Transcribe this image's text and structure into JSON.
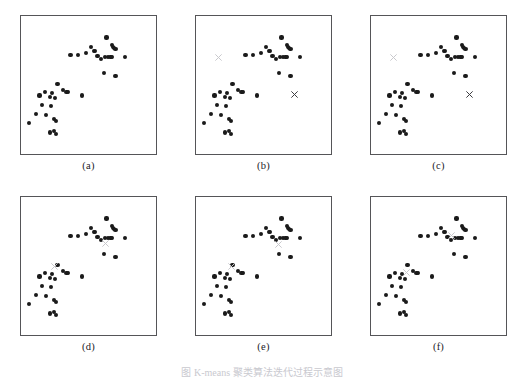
{
  "figure": {
    "title_caption": "图  K-means  聚类算法迭代过程示意图",
    "background_color": "#ffffff",
    "border_color": "#555558",
    "dot_color": "#1a1a1a",
    "centroid_color_light": "#c8c8cc",
    "centroid_color_dark": "#3a3a3e",
    "panel_labels": [
      "(a)",
      "(b)",
      "(c)",
      "(d)",
      "(e)",
      "(f)"
    ]
  },
  "chart_data": {
    "type": "scatter",
    "xlabel": "",
    "ylabel": "",
    "xlim": [
      0,
      100
    ],
    "ylim": [
      0,
      100
    ],
    "grid": false,
    "legend": "none",
    "marker_shapes": {
      "data_point": "filled-circle",
      "centroid": "cross"
    },
    "panels": [
      {
        "label": "(a)",
        "name": "original-data",
        "annotation": "Original unlabeled data points",
        "points": [
          [
            64,
            86
          ],
          [
            52,
            79
          ],
          [
            68,
            80
          ],
          [
            69,
            79
          ],
          [
            70,
            78
          ],
          [
            71,
            77
          ],
          [
            54,
            76
          ],
          [
            55,
            76
          ],
          [
            36,
            73
          ],
          [
            42,
            73
          ],
          [
            48,
            74
          ],
          [
            57,
            72
          ],
          [
            60,
            70
          ],
          [
            63,
            71
          ],
          [
            65,
            71
          ],
          [
            67,
            71
          ],
          [
            68,
            71
          ],
          [
            78,
            71
          ],
          [
            62,
            59
          ],
          [
            71,
            57
          ],
          [
            26,
            51
          ],
          [
            16,
            45
          ],
          [
            22,
            44
          ],
          [
            30,
            46
          ],
          [
            33,
            45
          ],
          [
            34,
            45
          ],
          [
            12,
            42
          ],
          [
            20,
            41
          ],
          [
            24,
            40
          ],
          [
            45,
            42
          ],
          [
            14,
            35
          ],
          [
            21,
            34
          ],
          [
            9,
            28
          ],
          [
            17,
            27
          ],
          [
            23,
            24
          ],
          [
            25,
            23
          ],
          [
            4,
            21
          ],
          [
            20,
            14
          ],
          [
            23,
            15
          ],
          [
            25,
            13
          ]
        ],
        "centroids": []
      },
      {
        "label": "(b)",
        "name": "initial-centroids",
        "annotation": "Two initial centroids placed randomly",
        "points": [
          [
            64,
            86
          ],
          [
            52,
            79
          ],
          [
            68,
            80
          ],
          [
            69,
            79
          ],
          [
            70,
            78
          ],
          [
            71,
            77
          ],
          [
            54,
            76
          ],
          [
            55,
            76
          ],
          [
            36,
            73
          ],
          [
            42,
            73
          ],
          [
            48,
            74
          ],
          [
            57,
            72
          ],
          [
            60,
            70
          ],
          [
            63,
            71
          ],
          [
            65,
            71
          ],
          [
            67,
            71
          ],
          [
            68,
            71
          ],
          [
            78,
            71
          ],
          [
            62,
            59
          ],
          [
            71,
            57
          ],
          [
            26,
            51
          ],
          [
            16,
            45
          ],
          [
            22,
            44
          ],
          [
            30,
            46
          ],
          [
            33,
            45
          ],
          [
            34,
            45
          ],
          [
            12,
            42
          ],
          [
            20,
            41
          ],
          [
            24,
            40
          ],
          [
            45,
            42
          ],
          [
            14,
            35
          ],
          [
            21,
            34
          ],
          [
            9,
            28
          ],
          [
            17,
            27
          ],
          [
            23,
            24
          ],
          [
            25,
            23
          ],
          [
            4,
            21
          ],
          [
            20,
            14
          ],
          [
            23,
            15
          ],
          [
            25,
            13
          ]
        ],
        "centroids": [
          {
            "x": 15,
            "y": 71,
            "shade": "light"
          },
          {
            "x": 74,
            "y": 43,
            "shade": "dark"
          }
        ]
      },
      {
        "label": "(c)",
        "name": "assignment-step",
        "annotation": "Points assigned to nearest centroid",
        "points": [
          [
            64,
            86
          ],
          [
            52,
            79
          ],
          [
            68,
            80
          ],
          [
            69,
            79
          ],
          [
            70,
            78
          ],
          [
            71,
            77
          ],
          [
            54,
            76
          ],
          [
            55,
            76
          ],
          [
            36,
            73
          ],
          [
            42,
            73
          ],
          [
            48,
            74
          ],
          [
            57,
            72
          ],
          [
            60,
            70
          ],
          [
            63,
            71
          ],
          [
            65,
            71
          ],
          [
            67,
            71
          ],
          [
            68,
            71
          ],
          [
            78,
            71
          ],
          [
            62,
            59
          ],
          [
            71,
            57
          ],
          [
            26,
            51
          ],
          [
            16,
            45
          ],
          [
            22,
            44
          ],
          [
            30,
            46
          ],
          [
            33,
            45
          ],
          [
            34,
            45
          ],
          [
            12,
            42
          ],
          [
            20,
            41
          ],
          [
            24,
            40
          ],
          [
            45,
            42
          ],
          [
            14,
            35
          ],
          [
            21,
            34
          ],
          [
            9,
            28
          ],
          [
            17,
            27
          ],
          [
            23,
            24
          ],
          [
            25,
            23
          ],
          [
            4,
            21
          ],
          [
            20,
            14
          ],
          [
            23,
            15
          ],
          [
            25,
            13
          ]
        ],
        "centroids": [
          {
            "x": 15,
            "y": 71,
            "shade": "light"
          },
          {
            "x": 74,
            "y": 43,
            "shade": "dark"
          }
        ]
      },
      {
        "label": "(d)",
        "name": "update-step-1",
        "annotation": "Centroids moved to cluster means",
        "points": [
          [
            64,
            86
          ],
          [
            52,
            79
          ],
          [
            68,
            80
          ],
          [
            69,
            79
          ],
          [
            70,
            78
          ],
          [
            71,
            77
          ],
          [
            54,
            76
          ],
          [
            55,
            76
          ],
          [
            36,
            73
          ],
          [
            42,
            73
          ],
          [
            48,
            74
          ],
          [
            57,
            72
          ],
          [
            60,
            70
          ],
          [
            63,
            71
          ],
          [
            65,
            71
          ],
          [
            67,
            71
          ],
          [
            68,
            71
          ],
          [
            78,
            71
          ],
          [
            62,
            59
          ],
          [
            71,
            57
          ],
          [
            26,
            51
          ],
          [
            16,
            45
          ],
          [
            22,
            44
          ],
          [
            30,
            46
          ],
          [
            33,
            45
          ],
          [
            34,
            45
          ],
          [
            12,
            42
          ],
          [
            20,
            41
          ],
          [
            24,
            40
          ],
          [
            45,
            42
          ],
          [
            14,
            35
          ],
          [
            21,
            34
          ],
          [
            9,
            28
          ],
          [
            17,
            27
          ],
          [
            23,
            24
          ],
          [
            25,
            23
          ],
          [
            4,
            21
          ],
          [
            20,
            14
          ],
          [
            23,
            15
          ],
          [
            25,
            13
          ]
        ],
        "centroids": [
          {
            "x": 24,
            "y": 50,
            "shade": "light"
          },
          {
            "x": 63,
            "y": 67,
            "shade": "light"
          }
        ]
      },
      {
        "label": "(e)",
        "name": "update-step-2",
        "annotation": "Centroids refined further",
        "points": [
          [
            64,
            86
          ],
          [
            52,
            79
          ],
          [
            68,
            80
          ],
          [
            69,
            79
          ],
          [
            70,
            78
          ],
          [
            71,
            77
          ],
          [
            54,
            76
          ],
          [
            55,
            76
          ],
          [
            36,
            73
          ],
          [
            42,
            73
          ],
          [
            48,
            74
          ],
          [
            57,
            72
          ],
          [
            60,
            70
          ],
          [
            63,
            71
          ],
          [
            65,
            71
          ],
          [
            67,
            71
          ],
          [
            68,
            71
          ],
          [
            78,
            71
          ],
          [
            62,
            59
          ],
          [
            71,
            57
          ],
          [
            26,
            51
          ],
          [
            16,
            45
          ],
          [
            22,
            44
          ],
          [
            30,
            46
          ],
          [
            33,
            45
          ],
          [
            34,
            45
          ],
          [
            12,
            42
          ],
          [
            20,
            41
          ],
          [
            24,
            40
          ],
          [
            45,
            42
          ],
          [
            14,
            35
          ],
          [
            21,
            34
          ],
          [
            9,
            28
          ],
          [
            17,
            27
          ],
          [
            23,
            24
          ],
          [
            25,
            23
          ],
          [
            4,
            21
          ],
          [
            20,
            14
          ],
          [
            23,
            15
          ],
          [
            25,
            13
          ]
        ],
        "centroids": [
          {
            "x": 25,
            "y": 50,
            "shade": "light"
          },
          {
            "x": 62,
            "y": 66,
            "shade": "light"
          }
        ]
      },
      {
        "label": "(f)",
        "name": "converged",
        "annotation": "Converged centroid positions",
        "points": [
          [
            64,
            86
          ],
          [
            52,
            79
          ],
          [
            68,
            80
          ],
          [
            69,
            79
          ],
          [
            70,
            78
          ],
          [
            71,
            77
          ],
          [
            54,
            76
          ],
          [
            55,
            76
          ],
          [
            36,
            73
          ],
          [
            42,
            73
          ],
          [
            48,
            74
          ],
          [
            57,
            72
          ],
          [
            60,
            70
          ],
          [
            63,
            71
          ],
          [
            65,
            71
          ],
          [
            67,
            71
          ],
          [
            68,
            71
          ],
          [
            78,
            71
          ],
          [
            62,
            59
          ],
          [
            71,
            57
          ],
          [
            26,
            51
          ],
          [
            16,
            45
          ],
          [
            22,
            44
          ],
          [
            30,
            46
          ],
          [
            33,
            45
          ],
          [
            34,
            45
          ],
          [
            12,
            42
          ],
          [
            20,
            41
          ],
          [
            24,
            40
          ],
          [
            45,
            42
          ],
          [
            14,
            35
          ],
          [
            21,
            34
          ],
          [
            9,
            28
          ],
          [
            17,
            27
          ],
          [
            23,
            24
          ],
          [
            25,
            23
          ],
          [
            4,
            21
          ],
          [
            20,
            14
          ],
          [
            23,
            15
          ],
          [
            25,
            13
          ]
        ],
        "centroids": [
          {
            "x": 25,
            "y": 45,
            "shade": "light"
          },
          {
            "x": 60,
            "y": 73,
            "shade": "light"
          }
        ]
      }
    ]
  }
}
